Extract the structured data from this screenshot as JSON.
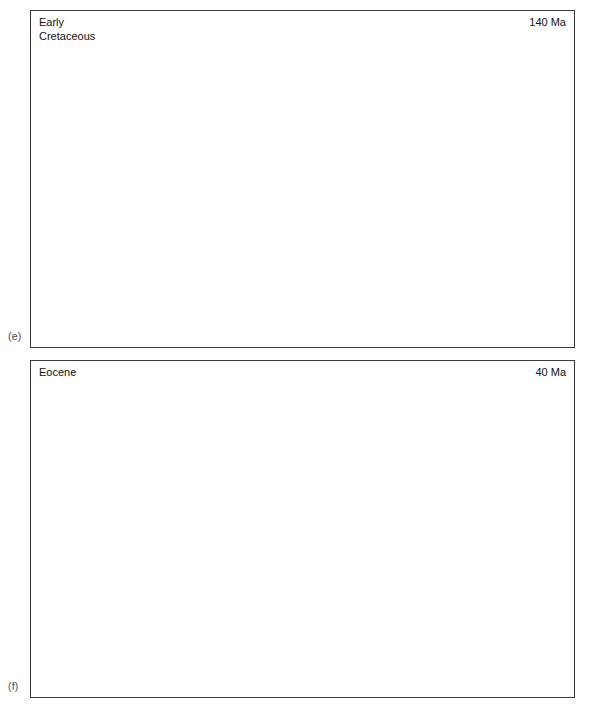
{
  "figure": {
    "background": "#ffffff",
    "width": 591,
    "height": 710,
    "colors": {
      "ocean": "#e9e9e9",
      "shelf": "#ffffff",
      "land": "#a9a9a9",
      "outline": "#111111",
      "graticule": "#4d4d4d",
      "frame": "#3a3a3a",
      "climate_dash": "#000000",
      "coast_dash": "#555555"
    }
  },
  "panels": [
    {
      "tag": "(e)",
      "era": "Early\nCretaceous",
      "age": "140 Ma",
      "lat_labels": [
        {
          "text": "60°N",
          "lat": 60
        },
        {
          "text": "30°N",
          "lat": 30
        },
        {
          "text": "0°",
          "lat": 0
        },
        {
          "text": "30°S",
          "lat": -30
        },
        {
          "text": "60°S",
          "lat": -60
        }
      ],
      "plate_labels": [
        {
          "text": "NL",
          "lon": -52,
          "lat": 54
        },
        {
          "text": "SL",
          "lon": -110,
          "lat": 36
        },
        {
          "text": "NG",
          "lon": -108,
          "lat": 1
        },
        {
          "text": "N",
          "lon": -96,
          "lat": -17
        },
        {
          "text": "SG",
          "lon": -90,
          "lat": -41
        },
        {
          "text": "WA",
          "lon": -16,
          "lat": -63
        },
        {
          "text": "EA",
          "lon": 44,
          "lat": -58
        }
      ],
      "climate_boundaries": [
        {
          "name": "northern-arid-boundary",
          "lat": 46
        },
        {
          "name": "northern-tropic-boundary",
          "lat": 29
        },
        {
          "name": "southern-arid-boundary",
          "lat": -33
        }
      ]
    },
    {
      "tag": "(f)",
      "era": "Eocene",
      "age": "40 Ma",
      "lat_labels": [
        {
          "text": "60°N",
          "lat": 60
        },
        {
          "text": "30°N",
          "lat": 30
        },
        {
          "text": "0°",
          "lat": 0
        },
        {
          "text": "30°S",
          "lat": -30
        },
        {
          "text": "60°S",
          "lat": -60
        }
      ],
      "plate_labels": [],
      "climate_boundaries": []
    }
  ],
  "graticule": {
    "meridian_step_deg": 30,
    "parallel_list": [
      60,
      30,
      0,
      -30,
      -60
    ],
    "lon_range": [
      -180,
      180
    ],
    "lat_range": [
      -90,
      90
    ]
  },
  "map_data": {
    "projection": "robinson-like-elliptical",
    "cretaceous_landmasses": [
      "north-laurasia",
      "south-laurasia",
      "north-gondwana",
      "south-gondwana",
      "west-antarctica",
      "east-antarctica",
      "proto-africa",
      "proto-south-america",
      "proto-india",
      "proto-australia"
    ],
    "eocene_landmasses": [
      "north-america",
      "south-america",
      "africa",
      "eurasia",
      "india",
      "australia",
      "antarctica",
      "greenland",
      "madagascar",
      "new-zealand",
      "tethys-seaway"
    ]
  }
}
